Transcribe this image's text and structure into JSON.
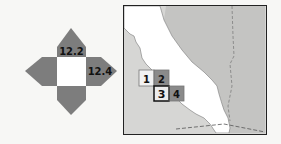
{
  "key_diagram": {
    "top_label": "12.2",
    "right_label": "12.4",
    "arm_color": "#7d7d7d",
    "center_color": "#ffffff"
  },
  "locator_map": {
    "land_color": "#ffffff",
    "water_color": "#d6d6d4",
    "neighbor_color": "#c4c4c2",
    "tiles": [
      {
        "id": "1",
        "label": "1"
      },
      {
        "id": "2",
        "label": "2"
      },
      {
        "id": "3",
        "label": "3"
      },
      {
        "id": "4",
        "label": "4"
      }
    ]
  }
}
